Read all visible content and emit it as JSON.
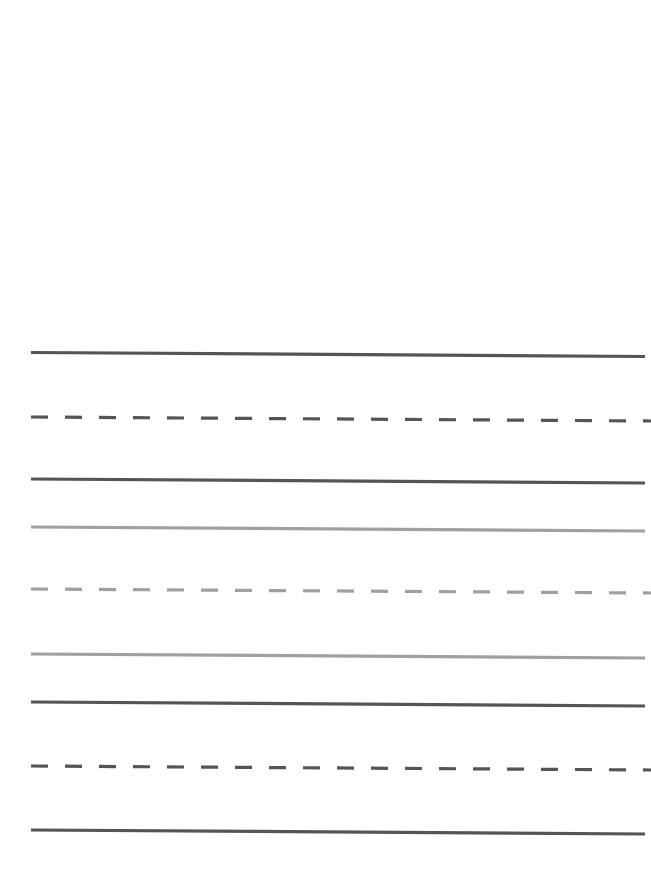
{
  "figure": {
    "title": "",
    "background_color": "#ffffff",
    "width": 651,
    "height": 880,
    "plot_area": {
      "x_start": 31,
      "x_end_solid": 645,
      "x_end_dashed": 651,
      "y_top": 352,
      "y_bottom": 834
    }
  },
  "palette": {
    "dark_gray": "#555555",
    "light_gray": "#a0a0a0",
    "white": "#ffffff"
  },
  "chart_data": {
    "type": "line",
    "title": "",
    "subtitle": "",
    "xlabel": "",
    "ylabel": "",
    "xlim": [
      0,
      651
    ],
    "ylim": [
      880,
      0
    ],
    "grid": false,
    "legend_position": "none",
    "axes_visible": false,
    "tick_labels_x": [],
    "tick_labels_y": [],
    "annotations": [],
    "series": [
      {
        "name": "line-1",
        "style": "solid",
        "color": "#555555",
        "width": 3.2,
        "dash_pattern": "none",
        "x": [
          31,
          645
        ],
        "y": [
          352.5,
          356.5
        ]
      },
      {
        "name": "line-2",
        "style": "dashed",
        "color": "#555555",
        "width": 3.2,
        "dash_pattern": "17,17",
        "x": [
          31,
          651
        ],
        "y": [
          417.0,
          421.0
        ]
      },
      {
        "name": "line-3",
        "style": "solid",
        "color": "#555555",
        "width": 3.2,
        "dash_pattern": "none",
        "x": [
          31,
          645
        ],
        "y": [
          479.0,
          483.0
        ]
      },
      {
        "name": "line-4",
        "style": "solid",
        "color": "#a0a0a0",
        "width": 3.2,
        "dash_pattern": "none",
        "x": [
          31,
          645
        ],
        "y": [
          527.0,
          531.0
        ]
      },
      {
        "name": "line-5",
        "style": "dashed",
        "color": "#a0a0a0",
        "width": 3.2,
        "dash_pattern": "17,17",
        "x": [
          31,
          651
        ],
        "y": [
          589.0,
          593.0
        ]
      },
      {
        "name": "line-6",
        "style": "solid",
        "color": "#a0a0a0",
        "width": 3.2,
        "dash_pattern": "none",
        "x": [
          31,
          645
        ],
        "y": [
          654.0,
          658.0
        ]
      },
      {
        "name": "line-7",
        "style": "solid",
        "color": "#555555",
        "width": 3.2,
        "dash_pattern": "none",
        "x": [
          31,
          645
        ],
        "y": [
          702.0,
          706.0
        ]
      },
      {
        "name": "line-8",
        "style": "dashed",
        "color": "#555555",
        "width": 3.2,
        "dash_pattern": "17,17",
        "x": [
          31,
          651
        ],
        "y": [
          766.0,
          770.0
        ]
      },
      {
        "name": "line-9",
        "style": "solid",
        "color": "#555555",
        "width": 3.2,
        "dash_pattern": "none",
        "x": [
          31,
          645
        ],
        "y": [
          830.0,
          834.0
        ]
      }
    ]
  }
}
